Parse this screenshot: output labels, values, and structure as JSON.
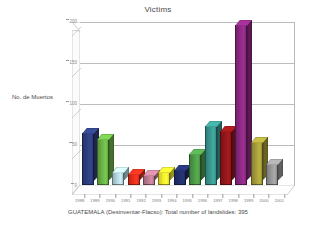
{
  "chart_data": {
    "type": "bar",
    "title": "Victims",
    "xlabel": "",
    "ylabel": "No. de Muertos",
    "categories": [
      "1988",
      "1989",
      "1990",
      "1991",
      "1992",
      "1993",
      "1994",
      "1995",
      "1996",
      "1997",
      "1998",
      "1999",
      "2000",
      "2001"
    ],
    "values": [
      64,
      56,
      16,
      13,
      12,
      16,
      18,
      38,
      72,
      66,
      195,
      52,
      26,
      0
    ],
    "ylim": [
      0,
      200
    ],
    "yticks": [
      "200",
      "150",
      "100",
      "50",
      "0"
    ],
    "grid": true,
    "legend": false,
    "series_colors": [
      "#2e3f80",
      "#6cb548",
      "#b8d9e0",
      "#e8301c",
      "#c07d94",
      "#f5ef2e",
      "#23306e",
      "#4f9e4a",
      "#3a9a92",
      "#96171b",
      "#8e2a84",
      "#a8a03a",
      "#9a9a9a",
      "#7f7f7f"
    ],
    "annotation": "GUATEMALA (Desinventar-Flacso): Total number of landslides: 395"
  },
  "chart": {
    "title": "Victims",
    "y_axis_label": "No. de Muertos",
    "caption": "GUATEMALA (Desinventar-Flacso): Total number of landslides: 395",
    "y_ticks": [
      "200",
      "150",
      "100",
      "50",
      "0"
    ],
    "x_labels": [
      "1988",
      "1989",
      "1990",
      "1991",
      "1992",
      "1993",
      "1994",
      "1995",
      "1996",
      "1997",
      "1998",
      "1999",
      "2000",
      "2001"
    ]
  }
}
